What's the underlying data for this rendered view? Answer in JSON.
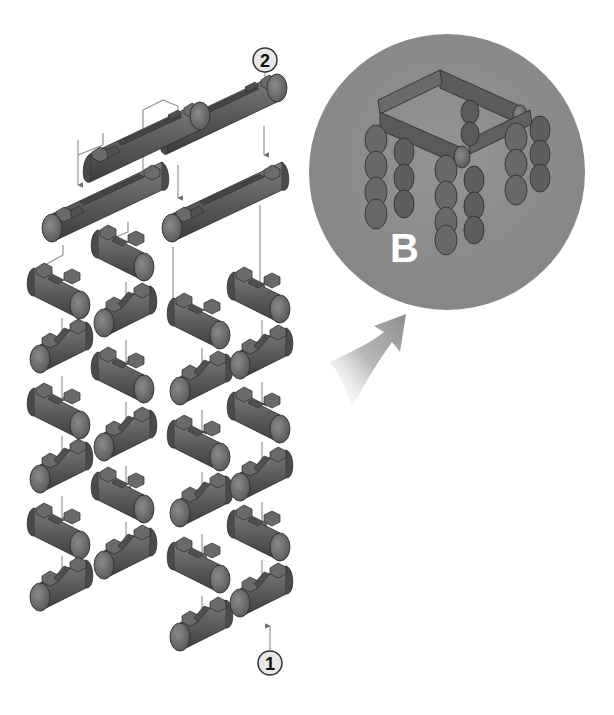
{
  "diagram": {
    "type": "exploded-assembly-instructions",
    "colors": {
      "background": "#ffffff",
      "part_fill": "#5a5a5a",
      "part_light": "#7a7a7a",
      "part_dark": "#3a3a3a",
      "inset_circle": "#8c8c8c",
      "leader_line": "#8a8a8a",
      "callout_fill": "#e6e6e6",
      "inset_label_color": "#ffffff"
    },
    "callouts": [
      {
        "id": "callout-1",
        "label": "1",
        "target": "short log piece (bottom of column 4)"
      },
      {
        "id": "callout-2",
        "label": "2",
        "target": "long top beam"
      }
    ],
    "inset": {
      "label": "B",
      "description": "assembled stool with four stacked-log legs and four beam frame"
    },
    "parts": {
      "long_beams": 4,
      "short_logs_per_column": [
        6,
        5,
        6,
        6
      ],
      "columns": 4
    }
  }
}
